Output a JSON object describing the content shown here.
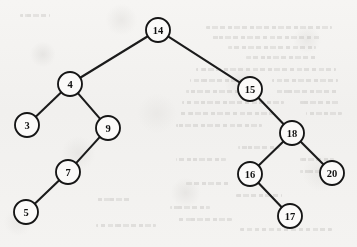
{
  "figure": {
    "name": "binary-search-tree-diagram",
    "caption": "",
    "background_color": "#f3f2f0",
    "ink_color": "#151515",
    "node_fill_color": "#fbfaf9",
    "node_radius": 12
  },
  "chart_data": {
    "type": "diagram",
    "diagram_kind": "binary-search-tree",
    "title": "",
    "xlabel": "",
    "ylabel": "",
    "root": "14",
    "nodes": [
      {
        "id": "n14",
        "label": "14",
        "x": 158,
        "y": 30,
        "depth": 0
      },
      {
        "id": "n4",
        "label": "4",
        "x": 70,
        "y": 84,
        "depth": 1
      },
      {
        "id": "n15",
        "label": "15",
        "x": 250,
        "y": 89,
        "depth": 1
      },
      {
        "id": "n3",
        "label": "3",
        "x": 27,
        "y": 125,
        "depth": 2
      },
      {
        "id": "n9",
        "label": "9",
        "x": 108,
        "y": 128,
        "depth": 2
      },
      {
        "id": "n18",
        "label": "18",
        "x": 292,
        "y": 133,
        "depth": 2
      },
      {
        "id": "n7",
        "label": "7",
        "x": 68,
        "y": 172,
        "depth": 3
      },
      {
        "id": "n16",
        "label": "16",
        "x": 250,
        "y": 174,
        "depth": 3
      },
      {
        "id": "n20",
        "label": "20",
        "x": 332,
        "y": 173,
        "depth": 3
      },
      {
        "id": "n5",
        "label": "5",
        "x": 26,
        "y": 212,
        "depth": 4
      },
      {
        "id": "n17",
        "label": "17",
        "x": 290,
        "y": 216,
        "depth": 4
      }
    ],
    "edges": [
      {
        "from": "n14",
        "to": "n4",
        "side": "left"
      },
      {
        "from": "n14",
        "to": "n15",
        "side": "right"
      },
      {
        "from": "n4",
        "to": "n3",
        "side": "left"
      },
      {
        "from": "n4",
        "to": "n9",
        "side": "right"
      },
      {
        "from": "n9",
        "to": "n7",
        "side": "left"
      },
      {
        "from": "n7",
        "to": "n5",
        "side": "left"
      },
      {
        "from": "n15",
        "to": "n18",
        "side": "right"
      },
      {
        "from": "n18",
        "to": "n16",
        "side": "left"
      },
      {
        "from": "n18",
        "to": "n20",
        "side": "right"
      },
      {
        "from": "n16",
        "to": "n17",
        "side": "right"
      }
    ],
    "values": [
      14,
      4,
      15,
      3,
      9,
      18,
      7,
      16,
      20,
      5,
      17
    ],
    "inorder_traversal": [
      3,
      4,
      5,
      7,
      9,
      14,
      15,
      16,
      17,
      18,
      20
    ]
  },
  "bleed_through": {
    "description": "faint illegible text showing through from the reverse page",
    "lines": [
      {
        "x": 206,
        "y": 26,
        "w": 126
      },
      {
        "x": 212,
        "y": 36,
        "w": 108
      },
      {
        "x": 228,
        "y": 46,
        "w": 88
      },
      {
        "x": 246,
        "y": 56,
        "w": 72
      },
      {
        "x": 196,
        "y": 68,
        "w": 140
      },
      {
        "x": 190,
        "y": 79,
        "w": 60
      },
      {
        "x": 272,
        "y": 79,
        "w": 66
      },
      {
        "x": 186,
        "y": 90,
        "w": 58
      },
      {
        "x": 276,
        "y": 90,
        "w": 62
      },
      {
        "x": 182,
        "y": 101,
        "w": 102
      },
      {
        "x": 300,
        "y": 101,
        "w": 40
      },
      {
        "x": 178,
        "y": 112,
        "w": 96
      },
      {
        "x": 306,
        "y": 112,
        "w": 36
      },
      {
        "x": 176,
        "y": 124,
        "w": 86
      },
      {
        "x": 238,
        "y": 146,
        "w": 42
      },
      {
        "x": 176,
        "y": 158,
        "w": 50
      },
      {
        "x": 300,
        "y": 158,
        "w": 34
      },
      {
        "x": 300,
        "y": 170,
        "w": 40
      },
      {
        "x": 186,
        "y": 182,
        "w": 44
      },
      {
        "x": 236,
        "y": 194,
        "w": 46
      },
      {
        "x": 170,
        "y": 206,
        "w": 40
      },
      {
        "x": 176,
        "y": 218,
        "w": 56
      },
      {
        "x": 240,
        "y": 228,
        "w": 92
      },
      {
        "x": 20,
        "y": 14,
        "w": 30
      },
      {
        "x": 96,
        "y": 198,
        "w": 34
      },
      {
        "x": 96,
        "y": 224,
        "w": 60
      }
    ]
  }
}
